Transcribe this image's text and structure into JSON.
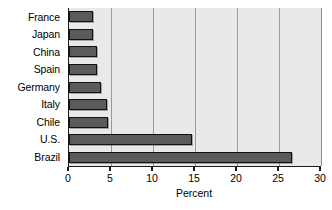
{
  "chart_data": {
    "type": "bar",
    "orientation": "horizontal",
    "title": "",
    "subtitle": "",
    "xlabel": "Percent",
    "ylabel": "",
    "categories": [
      "France",
      "Japan",
      "China",
      "Spain",
      "Germany",
      "Italy",
      "Chile",
      "U.S.",
      "Brazil"
    ],
    "values": [
      2.9,
      2.9,
      3.3,
      3.3,
      3.8,
      4.5,
      4.7,
      14.6,
      26.5
    ],
    "xlim": [
      0,
      30
    ],
    "xticks": [
      0,
      5,
      10,
      15,
      20,
      25,
      30
    ],
    "xtick_labels": [
      "0",
      "5",
      "10",
      "15",
      "20",
      "25",
      "30"
    ],
    "grid": true,
    "grid_axis": "x",
    "legend": false,
    "legend_position": "none",
    "bar_color": "#5b5b5b",
    "bar_edge_color": "#111111",
    "plot_background": "#e9e9e9",
    "gridline_color": "#9a9a9a",
    "axis_color": "#1a1a1a",
    "figure_background": "#ffffff"
  }
}
